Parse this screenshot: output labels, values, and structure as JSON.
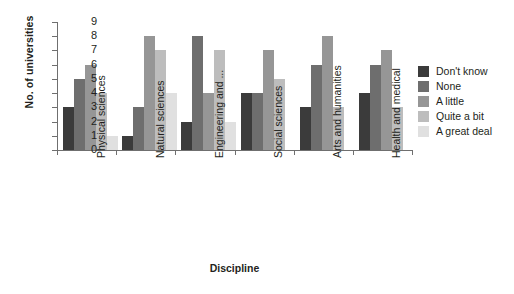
{
  "chart_data": {
    "type": "bar",
    "title": "",
    "xlabel": "Discipline",
    "ylabel": "No. of universities",
    "ylim": [
      0,
      9
    ],
    "yticks": [
      "0",
      "1",
      "2",
      "3",
      "4",
      "5",
      "6",
      "7",
      "8",
      "9"
    ],
    "grid": false,
    "legend_position": "right",
    "categories": [
      "Physical sciences",
      "Natural sciences",
      "Engineering and ...",
      "Social sciences",
      "Arts and humanities",
      "Health and medical"
    ],
    "series": [
      {
        "name": "Don't know",
        "color": "#3b3b3b",
        "values": [
          3,
          1,
          2,
          4,
          3,
          4
        ]
      },
      {
        "name": "None",
        "color": "#6e6e6e",
        "values": [
          5,
          3,
          8,
          4,
          6,
          6
        ]
      },
      {
        "name": "A little",
        "color": "#969696",
        "values": [
          6,
          8,
          4,
          7,
          8,
          7
        ]
      },
      {
        "name": "Quite a bit",
        "color": "#bdbdbd",
        "values": [
          4,
          7,
          7,
          5,
          3,
          3
        ]
      },
      {
        "name": "A great deal",
        "color": "#e0e0e0",
        "values": [
          1,
          4,
          2,
          0,
          0,
          0
        ]
      }
    ]
  },
  "axes": {
    "y_title": "No. of universities",
    "x_title": "Discipline"
  }
}
